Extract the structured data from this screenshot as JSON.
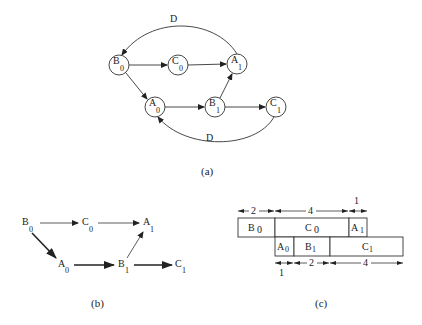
{
  "figure": {
    "panel_a": {
      "caption": "(a)",
      "nodes": [
        {
          "id": "B0",
          "letter": "B",
          "sub": "0"
        },
        {
          "id": "C0",
          "letter": "C",
          "sub": "0"
        },
        {
          "id": "A1",
          "letter": "A",
          "sub": "1"
        },
        {
          "id": "A0",
          "letter": "A",
          "sub": "0"
        },
        {
          "id": "B1",
          "letter": "B",
          "sub": "1"
        },
        {
          "id": "C1",
          "letter": "C",
          "sub": "1"
        }
      ],
      "edges": [
        {
          "from": "B0",
          "to": "C0"
        },
        {
          "from": "C0",
          "to": "A1"
        },
        {
          "from": "B0",
          "to": "A0"
        },
        {
          "from": "A0",
          "to": "B1"
        },
        {
          "from": "B1",
          "to": "A1"
        },
        {
          "from": "B1",
          "to": "C1"
        },
        {
          "from": "A1",
          "to": "B0",
          "label": "D"
        },
        {
          "from": "C1",
          "to": "A0",
          "label": "D"
        }
      ],
      "top_edge_label": "D",
      "bottom_edge_label": "D"
    },
    "panel_b": {
      "caption": "(b)",
      "nodes": [
        {
          "id": "B0",
          "letter": "B",
          "sub": "0"
        },
        {
          "id": "C0",
          "letter": "C",
          "sub": "0"
        },
        {
          "id": "A1",
          "letter": "A",
          "sub": "1"
        },
        {
          "id": "A0",
          "letter": "A",
          "sub": "0"
        },
        {
          "id": "B1",
          "letter": "B",
          "sub": "1"
        },
        {
          "id": "C1",
          "letter": "C",
          "sub": "1"
        }
      ],
      "edges": [
        {
          "from": "B0",
          "to": "C0",
          "weight": "thin"
        },
        {
          "from": "C0",
          "to": "A1",
          "weight": "thin"
        },
        {
          "from": "B0",
          "to": "A0",
          "weight": "thick"
        },
        {
          "from": "A0",
          "to": "B1",
          "weight": "thick"
        },
        {
          "from": "B1",
          "to": "A1",
          "weight": "thin"
        },
        {
          "from": "B1",
          "to": "C1",
          "weight": "thick"
        }
      ]
    },
    "panel_c": {
      "caption": "(c)",
      "top_row": [
        {
          "letter": "B",
          "sub": "0",
          "duration": "2"
        },
        {
          "letter": "C",
          "sub": "0",
          "duration": "4"
        },
        {
          "letter": "A",
          "sub": "1",
          "duration": "1"
        }
      ],
      "bottom_row": [
        {
          "letter": "A",
          "sub": "0",
          "duration": "1"
        },
        {
          "letter": "B",
          "sub": "1",
          "duration": "2"
        },
        {
          "letter": "C",
          "sub": "1",
          "duration": "4"
        }
      ]
    }
  }
}
